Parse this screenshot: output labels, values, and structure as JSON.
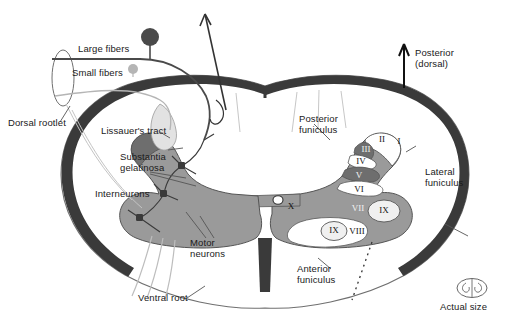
{
  "figure": {
    "colors": {
      "outline": "#6f6f6f",
      "white_matter_dark_band": "#3a3a3a",
      "gray_matter": "#9a9a9a",
      "gray_matter_dark": "#6e6e6e",
      "gray_matter_light": "#ffffff",
      "lissauer_tract": "#e2e2e2",
      "fiber_large": "#4a4a4a",
      "fiber_small": "#b5b5b5",
      "background": "#ffffff"
    }
  },
  "labels": {
    "large_fibers": "Large fibers",
    "small_fibers": "Small fibers",
    "dorsal_rootlet": "Dorsal rootlet",
    "lissauers_tract": "Lissauer's tract",
    "substantia_gelatinosa": "Substantia\ngelatinosa",
    "interneurons": "Interneurons",
    "motor_neurons": "Motor\nneurons",
    "ventral_root": "Ventral root",
    "posterior_funiculus": "Posterior\nfuniculus",
    "anterior_funiculus": "Anterior\nfuniculus",
    "lateral_funiculus": "Lateral\nfuniculus",
    "orientation_arrow": "Posterior\n(dorsal)",
    "actual_size": "Actual size"
  },
  "laminae": [
    {
      "id": "lamina-1",
      "numeral": "I",
      "x": 399,
      "y": 142,
      "shade": "light"
    },
    {
      "id": "lamina-2",
      "numeral": "II",
      "x": 382,
      "y": 140,
      "shade": "light"
    },
    {
      "id": "lamina-3",
      "numeral": "III",
      "x": 366,
      "y": 150,
      "shade": "dark"
    },
    {
      "id": "lamina-4",
      "numeral": "IV",
      "x": 361,
      "y": 162,
      "shade": "light"
    },
    {
      "id": "lamina-5",
      "numeral": "V",
      "x": 359,
      "y": 176,
      "shade": "dark"
    },
    {
      "id": "lamina-6",
      "numeral": "VI",
      "x": 359,
      "y": 190,
      "shade": "light"
    },
    {
      "id": "lamina-7",
      "numeral": "VII",
      "x": 358,
      "y": 209,
      "shade": "dark"
    },
    {
      "id": "lamina-8",
      "numeral": "VIII",
      "x": 357,
      "y": 232,
      "shade": "light"
    },
    {
      "id": "lamina-9a",
      "numeral": "IX",
      "x": 384,
      "y": 211,
      "shade": "light"
    },
    {
      "id": "lamina-9b",
      "numeral": "IX",
      "x": 334,
      "y": 231,
      "shade": "light"
    },
    {
      "id": "lamina-10",
      "numeral": "X",
      "x": 291,
      "y": 207,
      "shade": "light"
    }
  ]
}
